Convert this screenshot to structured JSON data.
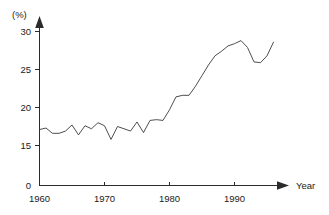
{
  "chart_data": {
    "type": "line",
    "title": "",
    "xlabel": "Year",
    "ylabel": "(%)",
    "unit_label": "(%)",
    "xlim": [
      1959,
      1997
    ],
    "ylim": [
      0,
      31
    ],
    "grid": false,
    "legend": "none",
    "y_axis_break": true,
    "y_tick_labels": [
      "0",
      "15",
      "20",
      "25",
      "30"
    ],
    "y_tick_values": [
      0,
      15,
      20,
      25,
      30
    ],
    "x_tick_labels": [
      "1960",
      "1970",
      "1980",
      "1990"
    ],
    "x_tick_values": [
      1960,
      1970,
      1980,
      1990
    ],
    "x": [
      1960,
      1961,
      1962,
      1963,
      1964,
      1965,
      1966,
      1967,
      1968,
      1969,
      1970,
      1971,
      1972,
      1973,
      1974,
      1975,
      1976,
      1977,
      1978,
      1979,
      1980,
      1981,
      1982,
      1983,
      1984,
      1985,
      1986,
      1987,
      1988,
      1989,
      1990,
      1991,
      1992,
      1993,
      1994,
      1995,
      1996
    ],
    "series": [
      {
        "name": "value",
        "color": "#3a3a3a",
        "values": [
          17.1,
          17.3,
          16.6,
          16.6,
          16.9,
          17.7,
          16.4,
          17.6,
          17.2,
          18.0,
          17.6,
          15.8,
          17.5,
          17.2,
          16.9,
          18.1,
          16.7,
          18.3,
          18.4,
          18.3,
          19.7,
          21.4,
          21.6,
          21.6,
          22.8,
          24.2,
          25.6,
          26.8,
          27.4,
          28.1,
          28.4,
          28.8,
          27.9,
          26.0,
          25.9,
          26.8,
          28.6
        ]
      }
    ]
  },
  "axes": {
    "y_unit": "(%)",
    "x_title": "Year"
  }
}
